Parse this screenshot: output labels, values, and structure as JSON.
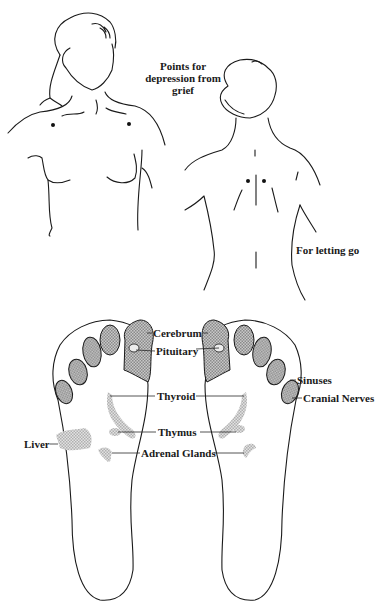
{
  "figure": {
    "top_section": {
      "front_figure": {
        "description": "Front view of woman's upper body with two points below collarbones",
        "points_count": 2
      },
      "back_figure": {
        "description": "Back view of woman's upper body with two points beside spine between shoulder blades",
        "points_count": 2
      },
      "captions": {
        "grief_line1": "Points for",
        "grief_line2": "depression from",
        "grief_line3": "grief",
        "letting_go": "For letting go"
      }
    },
    "bottom_section": {
      "description": "Soles of both feet with reflexology zones",
      "labels": {
        "cerebrum": "Cerebrum",
        "pituitary": "Pituitary",
        "sinuses": "Sinuses",
        "cranial_nerves": "Cranial Nerves",
        "thyroid": "Thyroid",
        "thymus": "Thymus",
        "liver": "Liver",
        "adrenal_glands": "Adrenal Glands"
      }
    },
    "colors": {
      "ink": "#1a1a1a",
      "hatch": "#8a8a8a",
      "background": "#ffffff"
    }
  }
}
